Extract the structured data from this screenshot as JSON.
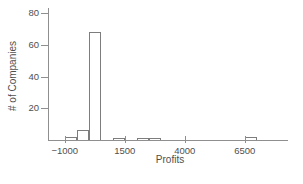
{
  "figure": {
    "background": "#ffffff",
    "axis_color": "#8f8f8f",
    "bar_fill": "#ffffff",
    "bar_border": "#7d7d7d",
    "text_color": "#4f4f4f"
  },
  "chart_data": {
    "type": "bar",
    "subtype": "histogram",
    "title": "",
    "xlabel": "Profits",
    "ylabel": "# of Companies",
    "xlim": [
      -1700,
      8300
    ],
    "ylim": [
      0,
      80
    ],
    "grid": false,
    "legend": "none",
    "x_ticks": [
      {
        "value": -1000,
        "label": "−1000"
      },
      {
        "value": 1500,
        "label": "1500"
      },
      {
        "value": 4000,
        "label": "4000"
      },
      {
        "value": 6500,
        "label": "6500"
      }
    ],
    "y_ticks": [
      {
        "value": 20,
        "label": "20"
      },
      {
        "value": 40,
        "label": "40"
      },
      {
        "value": 60,
        "label": "60"
      },
      {
        "value": 80,
        "label": "80"
      }
    ],
    "bins": [
      {
        "x0": -1000,
        "x1": -500,
        "count": 2
      },
      {
        "x0": -500,
        "x1": 0,
        "count": 6
      },
      {
        "x0": 0,
        "x1": 500,
        "count": 68
      },
      {
        "x0": 1000,
        "x1": 1500,
        "count": 1
      },
      {
        "x0": 2000,
        "x1": 2500,
        "count": 1
      },
      {
        "x0": 2500,
        "x1": 3000,
        "count": 1
      },
      {
        "x0": 6500,
        "x1": 7000,
        "count": 2
      }
    ]
  }
}
